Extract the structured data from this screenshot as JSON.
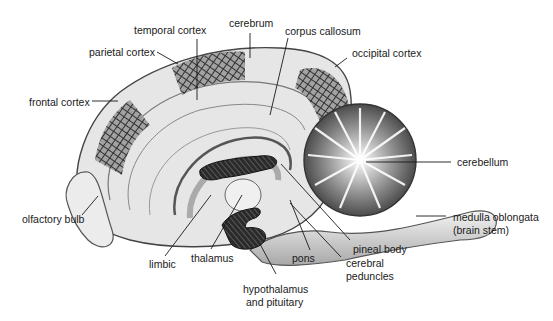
{
  "figure": {
    "colors": {
      "background": "#ffffff",
      "tissue_light": "#e9e9e9",
      "tissue_mid": "#bdbdbd",
      "tissue_dark": "#555555",
      "hatch": "#222222",
      "leader_line": "#1a1a1a",
      "label_text": "#1a1a1a"
    }
  },
  "labels": {
    "temporal_cortex": "temporal cortex",
    "cerebrum": "cerebrum",
    "corpus_callosum": "corpus callosum",
    "parietal_cortex": "parietal cortex",
    "occipital_cortex": "occipital cortex",
    "frontal_cortex": "frontal cortex",
    "cerebellum": "cerebellum",
    "olfactory_bulb": "olfactory bulb",
    "medulla_oblongata_line1": "medulla oblongata",
    "medulla_oblongata_line2": "(brain stem)",
    "pineal_body": "pineal body",
    "pons": "pons",
    "limbic": "limbic",
    "thalamus": "thalamus",
    "cerebral_peduncles_line1": "cerebral",
    "cerebral_peduncles_line2": "peduncles",
    "hypothalamus_line1": "hypothalamus",
    "hypothalamus_line2": "and pituitary"
  }
}
